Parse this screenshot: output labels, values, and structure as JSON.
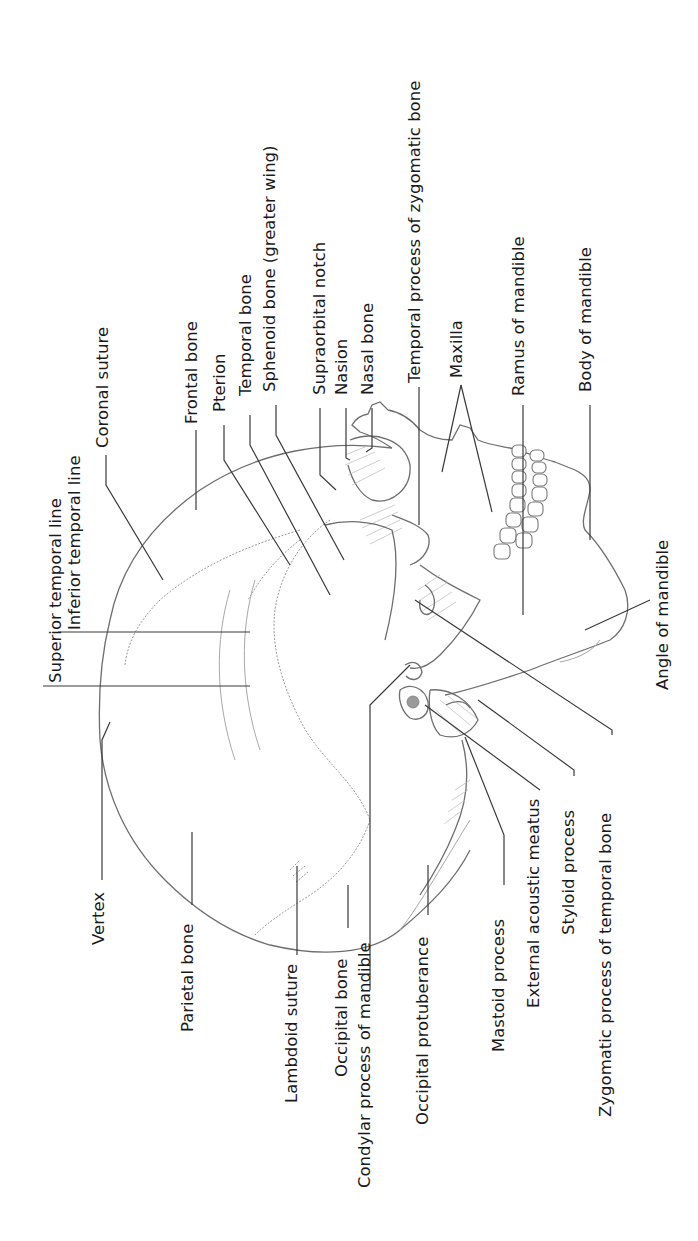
{
  "figure": {
    "orientation": "rotated counter-clockwise; labels read bottom-to-top",
    "colors": {
      "background": "#ffffff",
      "text": "#1a1a1a",
      "leader_lines": "#3a3a3a",
      "skull_outline": "#6e6e6e"
    }
  },
  "labels": {
    "superior_temporal_line": "Superior temporal line",
    "inferior_temporal_line": "Inferior temporal line",
    "coronal_suture": "Coronal suture",
    "frontal_bone": "Frontal bone",
    "pterion": "Pterion",
    "temporal_bone": "Temporal bone",
    "sphenoid_bone": "Sphenoid bone (greater wing)",
    "supraorbital_notch": "Supraorbital notch",
    "nasion": "Nasion",
    "nasal_bone": "Nasal bone",
    "temporal_process_zygomatic": "Temporal process of zygomatic bone",
    "maxilla": "Maxilla",
    "ramus_of_mandible": "Ramus of mandible",
    "body_of_mandible": "Body of mandible",
    "angle_of_mandible": "Angle of mandible",
    "vertex": "Vertex",
    "parietal_bone": "Parietal bone",
    "lambdoid_suture": "Lambdoid suture",
    "occipital_bone": "Occipital bone",
    "condylar_process": "Condylar process of mandible",
    "occipital_protuberance": "Occipital protuberance",
    "mastoid_process": "Mastoid process",
    "external_acoustic_meatus": "External acoustic meatus",
    "styloid_process": "Styloid process",
    "zygomatic_process_temporal": "Zygomatic process of temporal bone"
  }
}
